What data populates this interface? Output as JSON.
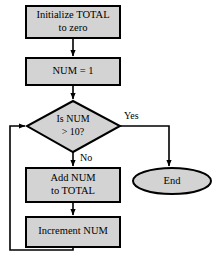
{
  "diagram": {
    "fill_color": "#d3d3d3",
    "stroke_color": "#000000",
    "background_color": "#ffffff",
    "nodes": {
      "initialize_total": {
        "shape": "process-rectangle",
        "line1": "Initialize TOTAL",
        "line2": "to zero"
      },
      "set_num": {
        "shape": "process-rectangle",
        "line1": "NUM = 1"
      },
      "decision_num": {
        "shape": "decision-diamond",
        "line1": "Is NUM",
        "line2": "> 10?"
      },
      "add_num": {
        "shape": "process-rectangle",
        "line1": "Add NUM",
        "line2": "to TOTAL"
      },
      "increment_num": {
        "shape": "process-rectangle",
        "line1": "Increment NUM"
      },
      "end_terminal": {
        "shape": "terminator-ellipse",
        "line1": "End"
      }
    },
    "branch_labels": {
      "yes": "Yes",
      "no": "No"
    }
  }
}
